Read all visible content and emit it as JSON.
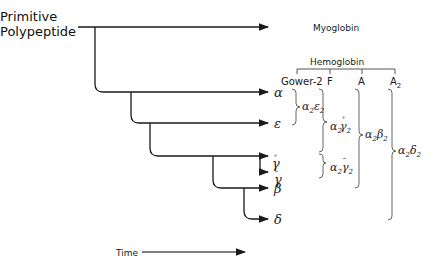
{
  "diagram": {
    "root_label_line1": "Primitive",
    "root_label_line2": "Polypeptide",
    "myoglobin_label": "Myoglobin",
    "hemoglobin_label": "Hemoglobin",
    "hemoglobin_types": [
      "Gower-2",
      "F",
      "A",
      "A2"
    ],
    "chains": [
      {
        "symbol": "α",
        "name": "alpha"
      },
      {
        "symbol": "ε",
        "name": "epsilon"
      },
      {
        "symbol": "γ",
        "prefix": "G",
        "name": "G-gamma"
      },
      {
        "symbol": "γ",
        "prefix": "A",
        "name": "A-gamma"
      },
      {
        "symbol": "β",
        "name": "beta"
      },
      {
        "symbol": "δ",
        "name": "delta"
      }
    ],
    "formulas": {
      "gower2": "α2ε2",
      "f_g": "α2Gγ2",
      "f_a": "α2Aγ2",
      "a": "α2β2",
      "a2": "α2δ2"
    },
    "time_label": "Time",
    "line_color": "#1a1a1a",
    "bracket_color": "#555555"
  }
}
